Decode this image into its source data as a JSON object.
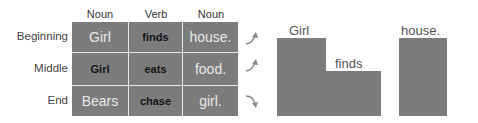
{
  "table": {
    "columns": [
      "Noun",
      "Verb",
      "Noun"
    ],
    "rows": [
      {
        "label": "Beginning",
        "cells": [
          {
            "text": "Girl",
            "style": "light"
          },
          {
            "text": "finds",
            "style": "dark"
          },
          {
            "text": "house.",
            "style": "light"
          }
        ],
        "arrow": "up"
      },
      {
        "label": "Middle",
        "cells": [
          {
            "text": "Girl",
            "style": "dark"
          },
          {
            "text": "eats",
            "style": "dark"
          },
          {
            "text": "food.",
            "style": "light"
          }
        ],
        "arrow": "up"
      },
      {
        "label": "End",
        "cells": [
          {
            "text": "Bears",
            "style": "light"
          },
          {
            "text": "chase",
            "style": "dark"
          },
          {
            "text": "girl.",
            "style": "light"
          }
        ],
        "arrow": "down"
      }
    ]
  },
  "blocks": {
    "labels": [
      "Girl",
      "finds",
      "house."
    ]
  },
  "colors": {
    "cell_fill": "#7c7c7c",
    "grid_line": "#e6e6e6"
  }
}
